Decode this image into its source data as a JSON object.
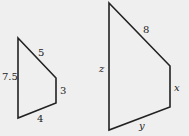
{
  "diagram": {
    "small_shape": {
      "vertices": [
        [
          18,
          38
        ],
        [
          56,
          78
        ],
        [
          56,
          103
        ],
        [
          18,
          118
        ]
      ],
      "labels": {
        "left": "7.5",
        "top": "5",
        "right": "3",
        "bottom": "4"
      }
    },
    "large_shape": {
      "vertices": [
        [
          109,
          3
        ],
        [
          170,
          66
        ],
        [
          170,
          107
        ],
        [
          109,
          130
        ]
      ],
      "labels": {
        "left": "z",
        "top": "8",
        "right": "x",
        "bottom": "y"
      }
    },
    "colors": {
      "background": "#efefef",
      "stroke": "#222222"
    }
  }
}
